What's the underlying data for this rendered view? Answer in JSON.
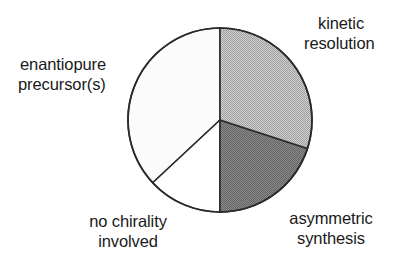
{
  "figure": {
    "background_color": "#ffffff",
    "text_color": "#1a1a1a"
  },
  "chart_data": {
    "type": "pie",
    "title": "",
    "subtitle": "",
    "xlabel": "",
    "ylabel": "",
    "legend_position": "none",
    "grid": false,
    "start_angle_deg": 0,
    "direction": "clockwise",
    "center": {
      "x": 220,
      "y": 120
    },
    "radius": 92,
    "outline_color": "#2b2b2b",
    "categories": [
      "kinetic resolution",
      "asymmetric synthesis",
      "no chirality involved",
      "enantiopure precursor(s)"
    ],
    "values": [
      30,
      20,
      13,
      37
    ],
    "angles_deg": [
      108,
      72,
      47,
      133
    ],
    "slices": [
      {
        "label": "kinetic resolution",
        "label_lines": [
          "kinetic",
          "resolution"
        ],
        "value": 30,
        "angle_deg": 108,
        "start_deg": 0,
        "end_deg": 108,
        "fill": "#b9b9b9",
        "pattern": "halftone-light"
      },
      {
        "label": "asymmetric synthesis",
        "label_lines": [
          "asymmetric",
          "synthesis"
        ],
        "value": 20,
        "angle_deg": 72,
        "start_deg": 108,
        "end_deg": 180,
        "fill": "#787878",
        "pattern": "halftone-dark"
      },
      {
        "label": "no chirality involved",
        "label_lines": [
          "no chirality",
          "involved"
        ],
        "value": 13,
        "angle_deg": 47,
        "start_deg": 180,
        "end_deg": 227,
        "fill": "#ffffff",
        "pattern": "none"
      },
      {
        "label": "enantiopure precursor(s)",
        "label_lines": [
          "enantiopure",
          "precursor(s)"
        ],
        "value": 37,
        "angle_deg": 133,
        "start_deg": 227,
        "end_deg": 360,
        "fill": "#fbfbfb",
        "pattern": "none"
      }
    ]
  },
  "labels": {
    "kinetic_resolution": {
      "line1": "kinetic",
      "line2": "resolution"
    },
    "enantiopure_precursors": {
      "line1": "enantiopure",
      "line2": "precursor(s)"
    },
    "asymmetric_synthesis": {
      "line1": "asymmetric",
      "line2": "synthesis"
    },
    "no_chirality_involved": {
      "line1": "no  chirality",
      "line2": "involved"
    }
  }
}
